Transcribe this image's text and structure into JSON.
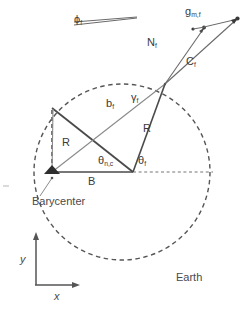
{
  "figure": {
    "name": "orbital-geometry-diagram",
    "background_color": "#ffffff",
    "stroke_color": "#4a4a4a",
    "light_stroke_color": "#777777",
    "width": 247,
    "height": 311
  },
  "labels": {
    "phi": {
      "base": "ϕ",
      "sub": "f"
    },
    "g_mf": {
      "base": "g",
      "sub": "m,f"
    },
    "N": {
      "base": "N",
      "sub": "f"
    },
    "C": {
      "base": "C",
      "sub": "f"
    },
    "b": {
      "base": "b",
      "sub": "f"
    },
    "gamma": {
      "base": "γ",
      "sub": "f"
    },
    "R_left": {
      "base": "R",
      "sub": ""
    },
    "R_right": {
      "base": "R",
      "sub": ""
    },
    "theta_nc": {
      "base": "θ",
      "sub": "n,c"
    },
    "theta_f": {
      "base": "θ",
      "sub": "f"
    },
    "B": {
      "base": "B",
      "sub": ""
    },
    "barycenter": "Barycenter",
    "earth": "Earth",
    "axis_y": "y",
    "axis_x": "x"
  },
  "geometry": {
    "circle": {
      "cx": 122,
      "cy": 172,
      "r": 88,
      "style": "dashed"
    },
    "barycenter_point": {
      "x": 52,
      "y": 172,
      "marker": "filled-triangle"
    },
    "upper_left_vertex": {
      "x": 52,
      "y": 108
    },
    "lower_vertex": {
      "x": 132,
      "y": 172
    },
    "circle_junction": {
      "x": 165,
      "y": 83
    },
    "arrow_tip_far": {
      "x": 238,
      "y": 18
    },
    "arrow_tip_near": {
      "x": 205,
      "y": 27
    },
    "dashed_reference_line": {
      "x1": 132,
      "y1": 172,
      "x2": 215,
      "y2": 172
    },
    "baseline": {
      "x1": 52,
      "y1": 172,
      "x2": 132,
      "y2": 172
    },
    "axes_origin": {
      "x": 36,
      "y": 285
    },
    "axes_y_top": {
      "x": 36,
      "y": 235
    },
    "axes_x_right": {
      "x": 78,
      "y": 285
    },
    "phi_wedge": {
      "x1": 75,
      "y1": 24,
      "x2": 135,
      "y2": 19
    }
  }
}
